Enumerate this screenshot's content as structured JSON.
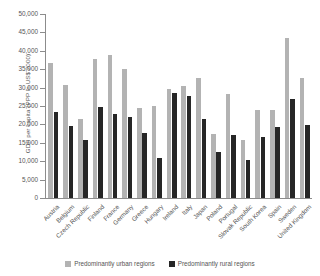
{
  "chart_data": {
    "type": "bar",
    "title": "",
    "xlabel": "",
    "ylabel": "GDP per capita (PPP in US$ 2000)",
    "ylim": [
      0,
      50000
    ],
    "ytick_values": [
      0,
      5000,
      10000,
      15000,
      20000,
      25000,
      30000,
      35000,
      40000,
      45000,
      50000
    ],
    "ytick_labels": [
      "0",
      "5,000",
      "10,000",
      "15,000",
      "20,000",
      "25,000",
      "30,000",
      "35,000",
      "40,000",
      "45,000",
      "50,000"
    ],
    "grid": false,
    "legend_position": "bottom",
    "categories": [
      "Austria",
      "Belgium",
      "Czech Republic",
      "Finland",
      "France",
      "Germany",
      "Greece",
      "Hungary",
      "Ireland",
      "Italy",
      "Japan",
      "Poland",
      "Portugal",
      "Slovak Republic",
      "South Korea",
      "Spain",
      "Sweden",
      "United Kingdom"
    ],
    "series": [
      {
        "name": "Predominantly urban regions",
        "color": "#b3b3b3",
        "values": [
          36800,
          30800,
          21500,
          37700,
          38900,
          35000,
          24500,
          25000,
          29600,
          30500,
          32600,
          17400,
          28200,
          15900,
          23900,
          23800,
          43500,
          32600
        ]
      },
      {
        "name": "Predominantly rural regions",
        "color": "#262626",
        "values": [
          23500,
          19700,
          15800,
          24600,
          22700,
          22000,
          17600,
          10900,
          28500,
          27700,
          21400,
          12400,
          17000,
          10300,
          16700,
          19200,
          27000,
          19900
        ]
      }
    ]
  },
  "legend": {
    "items": [
      {
        "label": "Predominantly urban regions",
        "color": "#b3b3b3"
      },
      {
        "label": "Predominantly rural regions",
        "color": "#262626"
      }
    ]
  }
}
